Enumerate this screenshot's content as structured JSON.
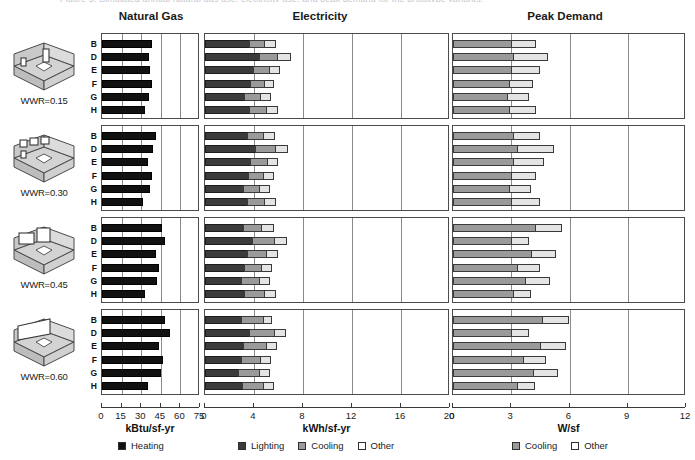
{
  "figure": {
    "cut_off_caption": "Figure 5. Simulated annual natural gas use, electricity use, and peak demand for the prototype variants.",
    "panels": [
      {
        "title": "Natural Gas",
        "axis_title": "kBtu/sf-yr",
        "ticks": [
          0,
          15,
          30,
          45,
          60,
          75
        ],
        "xmax": 75
      },
      {
        "title": "Electricity",
        "axis_title": "kWh/sf-yr",
        "ticks": [
          0,
          4,
          8,
          12,
          16,
          20
        ],
        "xmax": 20
      },
      {
        "title": "Peak Demand",
        "axis_title": "W/sf",
        "ticks": [
          0,
          3,
          6,
          9,
          12
        ],
        "xmax": 12
      }
    ],
    "groups": [
      {
        "label": "WWR=0.15"
      },
      {
        "label": "WWR=0.30"
      },
      {
        "label": "WWR=0.45"
      },
      {
        "label": "WWR=0.60"
      }
    ],
    "rows": [
      "B",
      "D",
      "E",
      "F",
      "G",
      "H"
    ],
    "legends": [
      {
        "panel": "Natural Gas",
        "entries": [
          {
            "label": "Heating",
            "key": "heating",
            "color": "#111111"
          }
        ]
      },
      {
        "panel": "Electricity",
        "entries": [
          {
            "label": "Lighting",
            "key": "lighting",
            "color": "#3b3b3b"
          },
          {
            "label": "Cooling",
            "key": "cooling",
            "color": "#9a9a9a"
          },
          {
            "label": "Other",
            "key": "other",
            "color": "#ffffff"
          }
        ]
      },
      {
        "panel": "Peak Demand",
        "entries": [
          {
            "label": "Cooling",
            "key": "cooling",
            "color": "#9a9a9a"
          },
          {
            "label": "Other",
            "key": "other",
            "color": "#ffffff"
          }
        ]
      }
    ]
  },
  "chart_data": [
    {
      "type": "bar",
      "title": "Natural Gas",
      "xlabel": "kBtu/sf-yr",
      "ylabel": "",
      "orientation": "horizontal",
      "stacked": true,
      "xlim": [
        0,
        75
      ],
      "xticks": [
        0,
        15,
        30,
        45,
        60,
        75
      ],
      "grid": true,
      "legend_position": "bottom",
      "series": [
        {
          "name": "Heating",
          "color": "#111111"
        }
      ],
      "groups": [
        {
          "group": "WWR=0.15",
          "categories": [
            "B",
            "D",
            "E",
            "F",
            "G",
            "H"
          ],
          "values": [
            38,
            36,
            37,
            38,
            36,
            33
          ]
        },
        {
          "group": "WWR=0.30",
          "categories": [
            "B",
            "D",
            "E",
            "F",
            "G",
            "H"
          ],
          "values": [
            41,
            39,
            35,
            38,
            37,
            31
          ]
        },
        {
          "group": "WWR=0.45",
          "categories": [
            "B",
            "D",
            "E",
            "F",
            "G",
            "H"
          ],
          "values": [
            46,
            48,
            41,
            44,
            42,
            33
          ]
        },
        {
          "group": "WWR=0.60",
          "categories": [
            "B",
            "D",
            "E",
            "F",
            "G",
            "H"
          ],
          "values": [
            48,
            52,
            44,
            47,
            45,
            35
          ]
        }
      ]
    },
    {
      "type": "bar",
      "title": "Electricity",
      "xlabel": "kWh/sf-yr",
      "ylabel": "",
      "orientation": "horizontal",
      "stacked": true,
      "xlim": [
        0,
        20
      ],
      "xticks": [
        0,
        4,
        8,
        12,
        16,
        20
      ],
      "grid": true,
      "legend_position": "bottom",
      "series": [
        {
          "name": "Lighting",
          "color": "#3b3b3b"
        },
        {
          "name": "Cooling",
          "color": "#9a9a9a"
        },
        {
          "name": "Other",
          "color": "#e4e4e4"
        }
      ],
      "groups": [
        {
          "group": "WWR=0.15",
          "categories": [
            "B",
            "D",
            "E",
            "F",
            "G",
            "H"
          ],
          "stacks": [
            [
              3.6,
              1.2,
              1.0
            ],
            [
              4.4,
              1.5,
              1.1
            ],
            [
              3.9,
              1.3,
              0.9
            ],
            [
              3.7,
              1.1,
              0.8
            ],
            [
              3.2,
              1.3,
              0.9
            ],
            [
              3.6,
              1.4,
              1.0
            ]
          ]
        },
        {
          "group": "WWR=0.30",
          "categories": [
            "B",
            "D",
            "E",
            "F",
            "G",
            "H"
          ],
          "stacks": [
            [
              3.4,
              1.3,
              1.0
            ],
            [
              4.1,
              1.6,
              1.1
            ],
            [
              3.7,
              1.4,
              0.9
            ],
            [
              3.5,
              1.2,
              0.9
            ],
            [
              3.1,
              1.3,
              0.9
            ],
            [
              3.4,
              1.4,
              1.0
            ]
          ]
        },
        {
          "group": "WWR=0.45",
          "categories": [
            "B",
            "D",
            "E",
            "F",
            "G",
            "H"
          ],
          "stacks": [
            [
              3.1,
              1.5,
              1.0
            ],
            [
              3.8,
              1.8,
              1.1
            ],
            [
              3.4,
              1.6,
              1.0
            ],
            [
              3.2,
              1.4,
              0.9
            ],
            [
              2.9,
              1.5,
              0.9
            ],
            [
              3.2,
              1.6,
              1.0
            ]
          ]
        },
        {
          "group": "WWR=0.60",
          "categories": [
            "B",
            "D",
            "E",
            "F",
            "G",
            "H"
          ],
          "stacks": [
            [
              2.9,
              1.8,
              0.8
            ],
            [
              3.6,
              2.0,
              1.0
            ],
            [
              3.1,
              1.9,
              0.9
            ],
            [
              2.9,
              1.6,
              0.9
            ],
            [
              2.7,
              1.7,
              0.9
            ],
            [
              3.0,
              1.7,
              0.9
            ]
          ]
        }
      ]
    },
    {
      "type": "bar",
      "title": "Peak Demand",
      "xlabel": "W/sf",
      "ylabel": "",
      "orientation": "horizontal",
      "stacked": true,
      "xlim": [
        0,
        12
      ],
      "xticks": [
        0,
        3,
        6,
        9,
        12
      ],
      "grid": true,
      "legend_position": "bottom",
      "series": [
        {
          "name": "Cooling",
          "color": "#9a9a9a"
        },
        {
          "name": "Other",
          "color": "#e4e4e4"
        }
      ],
      "groups": [
        {
          "group": "WWR=0.15",
          "categories": [
            "B",
            "D",
            "E",
            "F",
            "G",
            "H"
          ],
          "stacks": [
            [
              3.0,
              1.3
            ],
            [
              3.1,
              1.8
            ],
            [
              3.0,
              1.5
            ],
            [
              2.9,
              1.2
            ],
            [
              2.8,
              1.1
            ],
            [
              2.9,
              1.4
            ]
          ]
        },
        {
          "group": "WWR=0.30",
          "categories": [
            "B",
            "D",
            "E",
            "F",
            "G",
            "H"
          ],
          "stacks": [
            [
              3.1,
              1.4
            ],
            [
              3.3,
              1.9
            ],
            [
              3.1,
              1.6
            ],
            [
              3.0,
              1.3
            ],
            [
              2.9,
              1.1
            ],
            [
              3.0,
              1.5
            ]
          ]
        },
        {
          "group": "WWR=0.45",
          "categories": [
            "B",
            "D",
            "E",
            "F",
            "G",
            "H"
          ],
          "stacks": [
            [
              4.2,
              1.4
            ],
            [
              3.0,
              0.9
            ],
            [
              4.0,
              1.3
            ],
            [
              3.3,
              1.2
            ],
            [
              3.7,
              1.3
            ],
            [
              3.1,
              0.9
            ]
          ]
        },
        {
          "group": "WWR=0.60",
          "categories": [
            "B",
            "D",
            "E",
            "F",
            "G",
            "H"
          ],
          "stacks": [
            [
              4.6,
              1.4
            ],
            [
              3.0,
              0.9
            ],
            [
              4.5,
              1.3
            ],
            [
              3.6,
              1.2
            ],
            [
              4.1,
              1.3
            ],
            [
              3.3,
              0.9
            ]
          ]
        }
      ]
    }
  ]
}
